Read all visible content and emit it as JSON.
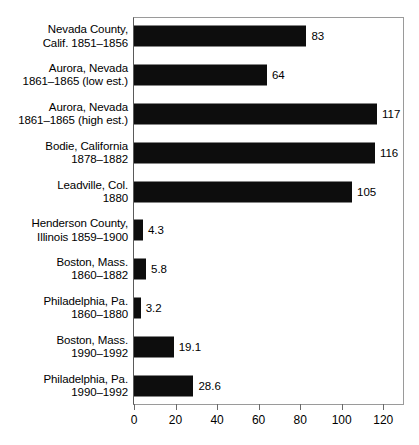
{
  "chart_data": {
    "type": "bar",
    "orientation": "horizontal",
    "title": "",
    "subtitle": "",
    "xlabel": "",
    "ylabel": "",
    "xlim": [
      0,
      130
    ],
    "grid": false,
    "legend": null,
    "xticks": [
      0,
      20,
      40,
      60,
      80,
      100,
      120
    ],
    "xtick_labels": [
      "0",
      "20",
      "40",
      "60",
      "80",
      "100",
      "120"
    ],
    "bar_color": "#0d0d0d",
    "categories": [
      "Nevada County, Calif. 1851–1856",
      "Aurora, Nevada 1861–1865 (low est.)",
      "Aurora, Nevada 1861–1865 (high est.)",
      "Bodie, California 1878–1882",
      "Leadville, Col. 1880",
      "Henderson County, Illinois 1859–1900",
      "Boston, Mass. 1860–1882",
      "Philadelphia, Pa. 1860–1880",
      "Boston, Mass. 1990–1992",
      "Philadelphia, Pa. 1990–1992"
    ],
    "values": [
      83,
      64,
      117,
      116,
      105,
      4.3,
      5.8,
      3.2,
      19.1,
      28.6
    ],
    "value_labels": [
      "83",
      "64",
      "117",
      "116",
      "105",
      "4.3",
      "5.8",
      "3.2",
      "19.1",
      "28.6"
    ]
  },
  "rows": [
    {
      "line1": "Nevada County,",
      "line2": "Calif. 1851–1856",
      "value": 83,
      "value_label": "83"
    },
    {
      "line1": "Aurora, Nevada",
      "line2": "1861–1865 (low est.)",
      "value": 64,
      "value_label": "64"
    },
    {
      "line1": "Aurora, Nevada",
      "line2": "1861–1865 (high est.)",
      "value": 117,
      "value_label": "117"
    },
    {
      "line1": "Bodie, California",
      "line2": "1878–1882",
      "value": 116,
      "value_label": "116"
    },
    {
      "line1": "Leadville, Col.",
      "line2": "1880",
      "value": 105,
      "value_label": "105"
    },
    {
      "line1": "Henderson County,",
      "line2": "Illinois 1859–1900",
      "value": 4.3,
      "value_label": "4.3"
    },
    {
      "line1": "Boston, Mass.",
      "line2": "1860–1882",
      "value": 5.8,
      "value_label": "5.8"
    },
    {
      "line1": "Philadelphia, Pa.",
      "line2": "1860–1880",
      "value": 3.2,
      "value_label": "3.2"
    },
    {
      "line1": "Boston, Mass.",
      "line2": "1990–1992",
      "value": 19.1,
      "value_label": "19.1"
    },
    {
      "line1": "Philadelphia, Pa.",
      "line2": "1990–1992",
      "value": 28.6,
      "value_label": "28.6"
    }
  ],
  "axis": {
    "ticks": [
      {
        "value": 0,
        "label": "0"
      },
      {
        "value": 20,
        "label": "20"
      },
      {
        "value": 40,
        "label": "40"
      },
      {
        "value": 60,
        "label": "60"
      },
      {
        "value": 80,
        "label": "80"
      },
      {
        "value": 100,
        "label": "100"
      },
      {
        "value": 120,
        "label": "120"
      }
    ],
    "max": 130
  }
}
